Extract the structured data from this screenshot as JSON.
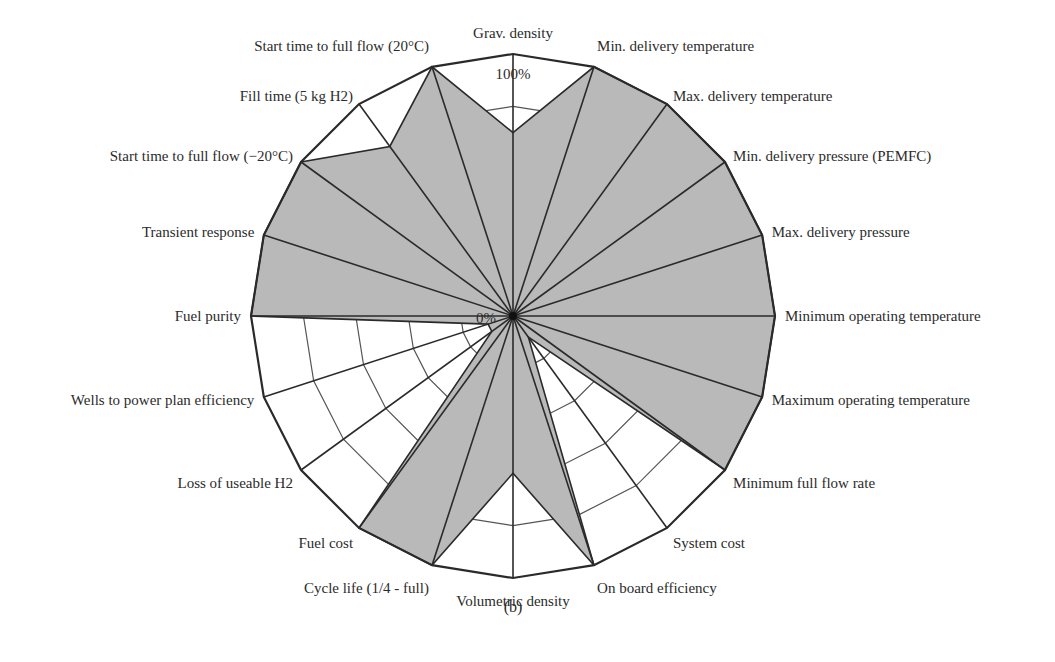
{
  "chart_data": {
    "type": "radar",
    "title": "",
    "caption": "(b)",
    "scale_labels": {
      "min": "0%",
      "max": "100%"
    },
    "range": [
      0,
      100
    ],
    "grid_rings": [
      20,
      40,
      60,
      80,
      100
    ],
    "axes": [
      "Grav. density",
      "Min. delivery temperature",
      "Max. delivery temperature",
      "Min. delivery pressure (PEMFC)",
      "Max. delivery pressure",
      "Minimum operating temperature",
      "Maximum operating temperature",
      "Minimum full flow rate",
      "System cost",
      "On board efficiency",
      "Volumetric density",
      "Cycle life (1/4 - full)",
      "Fuel cost",
      "Loss of useable H2",
      "Wells to power plan efficiency",
      "Fuel purity",
      "Transient response",
      "Start time to full flow (−20°C)",
      "Fill time (5 kg H2)",
      "Start time to full flow (20°C)"
    ],
    "series": [
      {
        "name": "Status",
        "values": [
          70,
          100,
          100,
          100,
          100,
          100,
          100,
          100,
          10,
          100,
          60,
          100,
          100,
          10,
          10,
          100,
          100,
          100,
          80,
          100
        ]
      }
    ],
    "colors": {
      "fill": "#b9b9b9",
      "outline": "#2a2a2a",
      "grid": "#555555",
      "spoke": "#2a2a2a",
      "background": "#ffffff"
    }
  }
}
